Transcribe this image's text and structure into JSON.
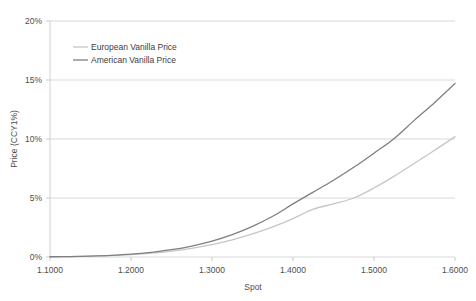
{
  "chart_data": {
    "type": "line",
    "title": "",
    "xlabel": "Spot",
    "ylabel": "Price (CCY1%)",
    "xlim": [
      1.1,
      1.6
    ],
    "ylim": [
      0,
      20
    ],
    "grid": true,
    "legend_position": "top-left-inside",
    "x_tick_labels": [
      "1.1000",
      "1.2000",
      "1.3000",
      "1.4000",
      "1.5000",
      "1.6000"
    ],
    "x_ticks": [
      1.1,
      1.2,
      1.3,
      1.4,
      1.5,
      1.6
    ],
    "y_tick_labels": [
      "0%",
      "5%",
      "10%",
      "15%",
      "20%"
    ],
    "y_ticks": [
      0,
      5,
      10,
      15,
      20
    ],
    "x": [
      1.1,
      1.125,
      1.15,
      1.175,
      1.2,
      1.225,
      1.25,
      1.275,
      1.3,
      1.325,
      1.35,
      1.375,
      1.4,
      1.425,
      1.45,
      1.475,
      1.5,
      1.525,
      1.55,
      1.575,
      1.6
    ],
    "series": [
      {
        "name": "European Vanilla Price",
        "color": "#c6c6c6",
        "values": [
          0.02,
          0.04,
          0.07,
          0.12,
          0.2,
          0.32,
          0.5,
          0.74,
          1.05,
          1.45,
          1.95,
          2.55,
          3.25,
          4.05,
          4.5,
          5.0,
          5.85,
          6.85,
          7.95,
          9.05,
          10.2
        ]
      },
      {
        "name": "American Vanilla Price",
        "color": "#7f7f7f",
        "values": [
          0.02,
          0.04,
          0.08,
          0.14,
          0.24,
          0.4,
          0.62,
          0.93,
          1.35,
          1.9,
          2.6,
          3.45,
          4.5,
          5.5,
          6.5,
          7.6,
          8.8,
          10.05,
          11.6,
          13.1,
          14.7
        ]
      }
    ]
  },
  "legend": {
    "items": [
      {
        "label": "European Vanilla Price",
        "color": "#c6c6c6"
      },
      {
        "label": "American Vanilla Price",
        "color": "#7f7f7f"
      }
    ]
  },
  "axes": {
    "x_title": "Spot",
    "y_title": "Price (CCY1%)"
  },
  "colors": {
    "background": "#ffffff",
    "gridline": "#d9d9d9",
    "axis_line": "#d0d0d0",
    "tick_text": "#4d4d4d",
    "european": "#c6c6c6",
    "american": "#7f7f7f"
  }
}
